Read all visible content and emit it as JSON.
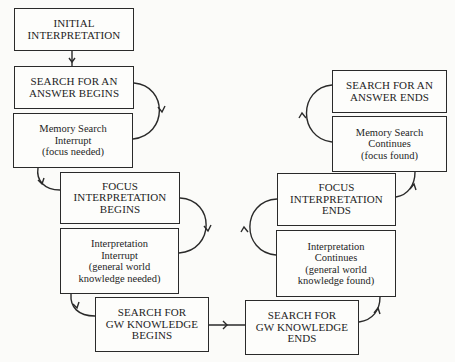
{
  "diagram": {
    "nodes": [
      {
        "id": "initial-interpretation",
        "lines": [
          "INITIAL",
          "INTERPRETATION"
        ],
        "style": "caps",
        "x": 14,
        "y": 8,
        "w": 120,
        "h": 43
      },
      {
        "id": "search-answer-begins",
        "lines": [
          "SEARCH FOR AN",
          "ANSWER BEGINS"
        ],
        "style": "caps",
        "x": 14,
        "y": 66,
        "w": 120,
        "h": 43
      },
      {
        "id": "memory-search-interrupt",
        "lines": [
          "Memory Search",
          "Interrupt",
          "(focus needed)"
        ],
        "style": "lower",
        "x": 13,
        "y": 113,
        "w": 120,
        "h": 55
      },
      {
        "id": "focus-interpretation-begins",
        "lines": [
          "FOCUS",
          "INTERPRETATION",
          "BEGINS"
        ],
        "style": "caps",
        "x": 60,
        "y": 172,
        "w": 120,
        "h": 52
      },
      {
        "id": "interpretation-interrupt",
        "lines": [
          "Interpretation",
          "Interrupt",
          "(general world",
          "knowledge needed)"
        ],
        "style": "lower",
        "x": 60,
        "y": 228,
        "w": 119,
        "h": 66
      },
      {
        "id": "search-gw-knowledge-begins",
        "lines": [
          "SEARCH FOR",
          "GW KNOWLEDGE",
          "BEGINS"
        ],
        "style": "caps",
        "x": 95,
        "y": 297,
        "w": 114,
        "h": 55
      },
      {
        "id": "search-gw-knowledge-ends",
        "lines": [
          "SEARCH FOR",
          "GW KNOWLEDGE",
          "ENDS"
        ],
        "style": "caps",
        "x": 245,
        "y": 300,
        "w": 114,
        "h": 55
      },
      {
        "id": "interpretation-continues",
        "lines": [
          "Interpretation",
          "Continues",
          "(general world",
          "knowledge found)"
        ],
        "style": "lower",
        "x": 276,
        "y": 230,
        "w": 120,
        "h": 67
      },
      {
        "id": "focus-interpretation-ends",
        "lines": [
          "FOCUS",
          "INTERPRETATION",
          "ENDS"
        ],
        "style": "caps",
        "x": 277,
        "y": 173,
        "w": 119,
        "h": 53
      },
      {
        "id": "memory-search-continues",
        "lines": [
          "Memory Search",
          "Continues",
          "(focus found)"
        ],
        "style": "lower",
        "x": 332,
        "y": 116,
        "w": 115,
        "h": 56
      },
      {
        "id": "search-answer-ends",
        "lines": [
          "SEARCH FOR AN",
          "ANSWER ENDS"
        ],
        "style": "caps",
        "x": 332,
        "y": 70,
        "w": 115,
        "h": 43
      }
    ],
    "edges": [
      {
        "from": "initial-interpretation",
        "to": "search-answer-begins",
        "type": "straight-down"
      },
      {
        "from": "search-answer-begins",
        "to": "memory-search-interrupt",
        "type": "right-loop"
      },
      {
        "from": "memory-search-interrupt",
        "to": "focus-interpretation-begins",
        "type": "hook-down-right"
      },
      {
        "from": "focus-interpretation-begins",
        "to": "interpretation-interrupt",
        "type": "right-loop"
      },
      {
        "from": "interpretation-interrupt",
        "to": "search-gw-knowledge-begins",
        "type": "hook-down-right"
      },
      {
        "from": "search-gw-knowledge-begins",
        "to": "search-gw-knowledge-ends",
        "type": "straight-right"
      },
      {
        "from": "search-gw-knowledge-ends",
        "to": "interpretation-continues",
        "type": "hook-right-up"
      },
      {
        "from": "interpretation-continues",
        "to": "focus-interpretation-ends",
        "type": "left-loop"
      },
      {
        "from": "focus-interpretation-ends",
        "to": "memory-search-continues",
        "type": "hook-right-up"
      },
      {
        "from": "memory-search-continues",
        "to": "search-answer-ends",
        "type": "left-loop"
      }
    ],
    "colors": {
      "ink": "#2a2a2a",
      "paper": "#fbfbf9"
    }
  }
}
